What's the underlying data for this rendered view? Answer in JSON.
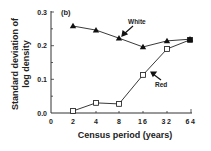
{
  "chart_data": {
    "type": "line",
    "title": "",
    "panel_label": "(b)",
    "xlabel": "Census period (years)",
    "ylabel_line1": "Standard deviation of",
    "ylabel_line2": "log density",
    "x_scale": "log2 (categorical ticks)",
    "x": [
      2,
      4,
      8,
      16,
      32,
      64
    ],
    "x_ticks": [
      "0",
      "2",
      "4",
      "8",
      "16",
      "32",
      "64"
    ],
    "y_ticks": [
      "0.0",
      "0.1",
      "0.2",
      "0.3"
    ],
    "ylim": [
      0.0,
      0.3
    ],
    "grid": false,
    "legend": "inline annotations with arrows",
    "series": [
      {
        "name": "White",
        "marker": "filled-triangle",
        "values": [
          0.258,
          0.246,
          0.222,
          0.196,
          0.214,
          0.219
        ]
      },
      {
        "name": "Red",
        "marker": "open-square",
        "values": [
          0.006,
          0.03,
          0.027,
          0.113,
          0.19,
          0.217
        ]
      }
    ],
    "annotations": [
      {
        "text": "White",
        "points_to": "White series"
      },
      {
        "text": "Red",
        "points_to": "Red series"
      }
    ]
  }
}
